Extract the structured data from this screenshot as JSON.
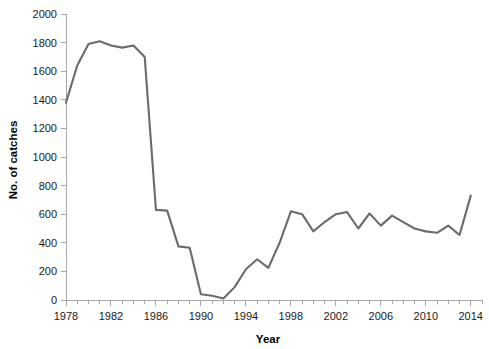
{
  "chart_data": {
    "type": "line",
    "title": "",
    "xlabel": "Year",
    "ylabel": "No. of catches",
    "xlim": [
      1978,
      2015
    ],
    "ylim": [
      0,
      2000
    ],
    "grid": false,
    "legend": false,
    "line_color": "#6b6b6b",
    "axis_color": "#a6a6a6",
    "x_tick_labels": [
      "1978",
      "1982",
      "1986",
      "1990",
      "1994",
      "1998",
      "2002",
      "2006",
      "2010",
      "2014"
    ],
    "x_tick_values": [
      1978,
      1982,
      1986,
      1990,
      1994,
      1998,
      2002,
      2006,
      2010,
      2014
    ],
    "x_minor_step": 1,
    "y_tick_labels": [
      "0",
      "200",
      "400",
      "600",
      "800",
      "1000",
      "1200",
      "1400",
      "1600",
      "1800",
      "2000"
    ],
    "y_tick_values": [
      0,
      200,
      400,
      600,
      800,
      1000,
      1200,
      1400,
      1600,
      1800,
      2000
    ],
    "series": [
      {
        "name": "No. of catches",
        "x": [
          1978,
          1979,
          1980,
          1981,
          1982,
          1983,
          1984,
          1985,
          1986,
          1987,
          1988,
          1989,
          1990,
          1991,
          1992,
          1993,
          1994,
          1995,
          1996,
          1997,
          1998,
          1999,
          2000,
          2001,
          2002,
          2003,
          2004,
          2005,
          2006,
          2007,
          2008,
          2009,
          2010,
          2011,
          2012,
          2013,
          2014
        ],
        "values": [
          1380,
          1640,
          1790,
          1810,
          1780,
          1765,
          1780,
          1700,
          630,
          625,
          375,
          365,
          40,
          30,
          10,
          90,
          215,
          285,
          225,
          400,
          620,
          600,
          480,
          545,
          600,
          615,
          500,
          605,
          520,
          590,
          545,
          500,
          480,
          470,
          520,
          455,
          730
        ]
      }
    ]
  }
}
